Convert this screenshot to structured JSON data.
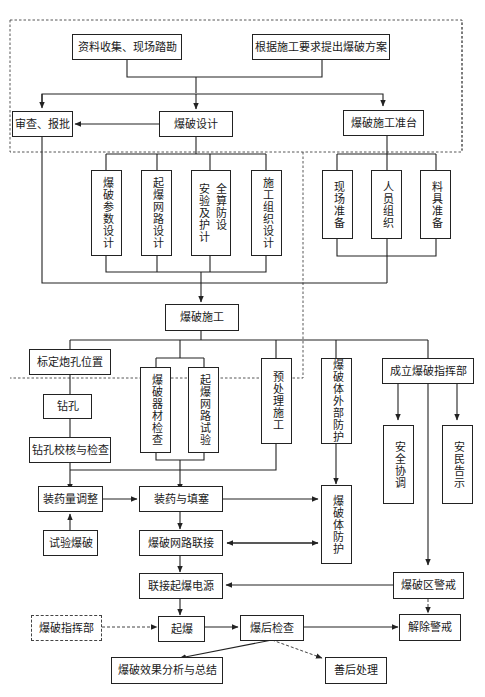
{
  "diagram": {
    "nodes": {
      "collect": "资料收集、现场踏勘",
      "plan": "根据施工要求提出爆破方案",
      "review": "审查、报批",
      "design": "爆破设计",
      "prep": "爆破施工准台",
      "param": "爆破参数设计",
      "network": "起爆网路设计",
      "safety": "全算防设\n安验及护计",
      "org": "施工组织设计",
      "site": "现场准备",
      "staff": "人员组织",
      "material": "料具准备",
      "construct": "爆破施工",
      "mark": "标定炮孔位置",
      "drill": "钻孔",
      "check_hole": "钻孔校核与检查",
      "equip_check": "爆破器材检查",
      "network_test": "起爆网路试验",
      "pretreat": "预处理施工",
      "outer_protect": "爆破体外部防护",
      "command_setup": "成立爆破指挥部",
      "safety_coord": "安全协调",
      "notice": "安民告示",
      "charge_adjust": "装药量调整",
      "trial": "试验爆破",
      "charge_fill": "装药与填塞",
      "body_protect": "爆破体防护",
      "network_connect": "爆破网路联接",
      "power_connect": "联接起爆电源",
      "alert": "爆破区警戒",
      "command": "爆破指挥部",
      "detonate": "起爆",
      "post_check": "爆后检查",
      "lift_alert": "解除警戒",
      "analysis": "爆破效果分析与总结",
      "aftermath": "善后处理"
    },
    "colors": {
      "line": "#222222",
      "dashed": "#555555",
      "background": "#ffffff"
    }
  }
}
